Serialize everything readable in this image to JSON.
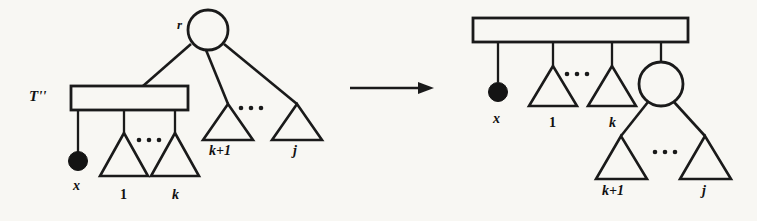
{
  "figure": {
    "background_color": "#f8f7f3",
    "ink_color": "#1a1a1a",
    "width": 757,
    "height": 221
  },
  "transform_arrow": {
    "name": "rightwards-arrow",
    "glyph": "→",
    "direction": "right"
  },
  "left_diagram": {
    "name": "before-tree",
    "root_label": "r",
    "subtree_label": "T''",
    "leaf_label": "x",
    "child_labels": [
      "1",
      "k"
    ],
    "right_child_labels": [
      "k+1",
      "j"
    ],
    "ellipsis": "...",
    "nodes": {
      "root": "circle",
      "bar": "rectangle",
      "x_leaf": "filled-dot",
      "subtrees": "triangle"
    }
  },
  "right_diagram": {
    "name": "after-tree",
    "bar_label": "",
    "leaf_label": "x",
    "child_labels": [
      "1",
      "k"
    ],
    "lower_child_labels": [
      "k+1",
      "j"
    ],
    "ellipsis": "...",
    "nodes": {
      "bar": "rectangle",
      "x_leaf": "filled-dot",
      "circle": "circle",
      "subtrees": "triangle"
    }
  }
}
